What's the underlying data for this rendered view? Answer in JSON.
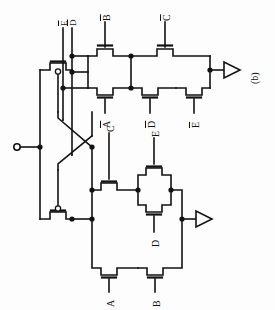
{
  "figure": {
    "caption": "(b)",
    "ink_color": "#121212",
    "background_color": "#fdfdfd"
  },
  "terminals": {
    "input_terminal": {
      "type": "open-circle",
      "label": ""
    },
    "outputs": [
      {
        "name": "output-top",
        "symbol": "buffer-triangle"
      },
      {
        "name": "output-bottom",
        "symbol": "buffer-triangle"
      }
    ]
  },
  "networks": {
    "upper": {
      "name": "complementary-network",
      "gate_labels": [
        {
          "id": "nEbar",
          "text": "E",
          "inverted": true
        },
        {
          "id": "nDbar",
          "text": "D",
          "inverted": true
        },
        {
          "id": "nBbar",
          "text": "B",
          "inverted": true
        },
        {
          "id": "nCbar",
          "text": "C",
          "inverted": true
        },
        {
          "id": "nAbar",
          "text": "A",
          "inverted": true
        },
        {
          "id": "nDbar2",
          "text": "D",
          "inverted": true
        },
        {
          "id": "nEbar2",
          "text": "E",
          "inverted": true
        }
      ]
    },
    "lower": {
      "name": "primary-network",
      "gate_labels": [
        {
          "id": "nC",
          "text": "C",
          "inverted": false
        },
        {
          "id": "nE",
          "text": "E",
          "inverted": false
        },
        {
          "id": "nD",
          "text": "D",
          "inverted": false
        },
        {
          "id": "nA",
          "text": "A",
          "inverted": false
        },
        {
          "id": "nB",
          "text": "B",
          "inverted": false
        }
      ]
    },
    "latch": {
      "name": "cross-coupled-pair",
      "transistors": [
        {
          "id": "xc-top",
          "type": "pmos-bubble-gate"
        },
        {
          "id": "xc-bottom",
          "type": "pmos-bubble-gate"
        }
      ]
    }
  }
}
